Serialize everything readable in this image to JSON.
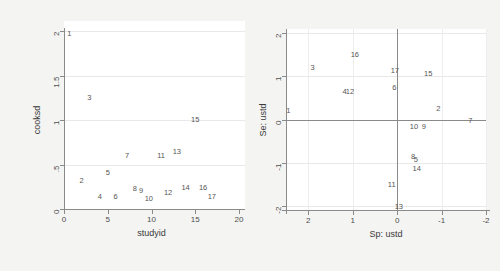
{
  "figure": {
    "background_color": "#f4f4f2",
    "panel_background": "#ffffff",
    "axis_color": "#8a8a8a",
    "grid_color": "#e8e8e8",
    "label_color": "#555555"
  },
  "chart_data": [
    {
      "id": "left",
      "type": "scatter",
      "title": "",
      "xlabel": "studyid",
      "ylabel": "cooksd",
      "xlim": [
        0,
        20
      ],
      "ylim": [
        0,
        2
      ],
      "xticks": [
        "0",
        "5",
        "10",
        "15",
        "20"
      ],
      "xtick_values": [
        0,
        5,
        10,
        15,
        20
      ],
      "yticks": [
        "0",
        ".5",
        "1",
        "1.5",
        "2"
      ],
      "ytick_values": [
        0,
        0.5,
        1,
        1.5,
        2
      ],
      "grid": "horizontal",
      "legend": "none",
      "marker_style": "text-label",
      "points": [
        {
          "label": "1",
          "x": 0.6,
          "y": 1.97
        },
        {
          "label": "2",
          "x": 2.0,
          "y": 0.31
        },
        {
          "label": "3",
          "x": 2.9,
          "y": 1.25
        },
        {
          "label": "4",
          "x": 4.1,
          "y": 0.13
        },
        {
          "label": "5",
          "x": 5.0,
          "y": 0.41
        },
        {
          "label": "6",
          "x": 5.9,
          "y": 0.13
        },
        {
          "label": "7",
          "x": 7.2,
          "y": 0.6
        },
        {
          "label": "8",
          "x": 8.1,
          "y": 0.23
        },
        {
          "label": "9",
          "x": 8.8,
          "y": 0.2
        },
        {
          "label": "10",
          "x": 9.7,
          "y": 0.11
        },
        {
          "label": "11",
          "x": 11.1,
          "y": 0.6
        },
        {
          "label": "12",
          "x": 11.9,
          "y": 0.18
        },
        {
          "label": "13",
          "x": 12.9,
          "y": 0.64
        },
        {
          "label": "14",
          "x": 13.9,
          "y": 0.24
        },
        {
          "label": "15",
          "x": 15.0,
          "y": 1.0
        },
        {
          "label": "16",
          "x": 15.9,
          "y": 0.24
        },
        {
          "label": "17",
          "x": 16.9,
          "y": 0.14
        }
      ]
    },
    {
      "id": "right",
      "type": "scatter",
      "title": "",
      "xlabel": "Sp: ustd",
      "ylabel": "Se: ustd",
      "xlim": [
        2.5,
        -2.0
      ],
      "ylim": [
        -2.1,
        2.1
      ],
      "x_axis_reversed": true,
      "xticks": [
        "2",
        "1",
        "0",
        "-1",
        "-2"
      ],
      "xtick_values": [
        2,
        1,
        0,
        -1,
        -2
      ],
      "yticks": [
        "2",
        "1",
        "0",
        "-1",
        "-2"
      ],
      "ytick_values": [
        2,
        1,
        0,
        -1,
        -2
      ],
      "grid": "both-faint",
      "zero_lines": true,
      "legend": "none",
      "marker_style": "text-label",
      "points": [
        {
          "label": "1",
          "x": 2.45,
          "y": 0.2
        },
        {
          "label": "2",
          "x": -0.93,
          "y": 0.25
        },
        {
          "label": "3",
          "x": 1.9,
          "y": 1.2
        },
        {
          "label": "4",
          "x": 1.18,
          "y": 0.63
        },
        {
          "label": "5",
          "x": -0.42,
          "y": -0.95
        },
        {
          "label": "6",
          "x": 0.06,
          "y": 0.73
        },
        {
          "label": "7",
          "x": -1.65,
          "y": -0.03
        },
        {
          "label": "8",
          "x": -0.36,
          "y": -0.86
        },
        {
          "label": "9",
          "x": -0.6,
          "y": -0.18
        },
        {
          "label": "10",
          "x": -0.38,
          "y": -0.18
        },
        {
          "label": "11",
          "x": 0.12,
          "y": -1.52
        },
        {
          "label": "12",
          "x": 1.06,
          "y": 0.63
        },
        {
          "label": "13",
          "x": -0.04,
          "y": -2.03
        },
        {
          "label": "14",
          "x": -0.44,
          "y": -1.15
        },
        {
          "label": "15",
          "x": -0.7,
          "y": 1.05
        },
        {
          "label": "16",
          "x": 0.95,
          "y": 1.5
        },
        {
          "label": "17",
          "x": 0.05,
          "y": 1.12
        }
      ]
    }
  ]
}
